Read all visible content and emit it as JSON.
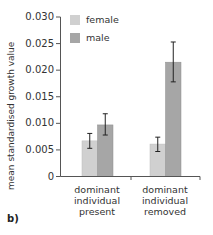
{
  "chart_data": {
    "type": "bar",
    "title": "",
    "panel_label": "b)",
    "xlabel": "",
    "ylabel": "mean standardised growth value",
    "ylim": [
      0,
      0.03
    ],
    "yticks": [
      "0.030",
      "0.025",
      "0.020",
      "0.015",
      "0.010",
      "0.005",
      "0"
    ],
    "grid": false,
    "legend_position": "top-left inside",
    "categories": [
      [
        "dominant",
        "individual",
        "present"
      ],
      [
        "dominant",
        "individual",
        "removed"
      ]
    ],
    "series": [
      {
        "name": "female",
        "color": "#d0d0d0",
        "values": [
          0.0067,
          0.0061
        ],
        "error_low": [
          0.0053,
          0.0047
        ],
        "error_high": [
          0.0081,
          0.0074
        ]
      },
      {
        "name": "male",
        "color": "#a6a6a6",
        "values": [
          0.0097,
          0.0215
        ],
        "error_low": [
          0.0078,
          0.0178
        ],
        "error_high": [
          0.0118,
          0.0253
        ]
      }
    ]
  }
}
